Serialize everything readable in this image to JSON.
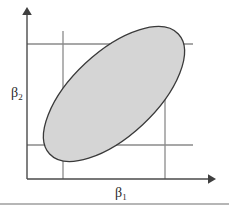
{
  "figure": {
    "background_color": "#ffffff",
    "width": 229,
    "height": 213,
    "axes": {
      "x_axis": {
        "label": "β",
        "label_subscript": "1",
        "label_x": 119,
        "label_y": 197,
        "line_color": "#4a4a4a",
        "origin_x": 27,
        "origin_y": 179,
        "end_x": 215,
        "arrow": "right-arrow"
      },
      "y_axis": {
        "label": "β",
        "label_subscript": "2",
        "label_x": 11,
        "label_y": 97,
        "line_color": "#4a4a4a",
        "origin_x": 27,
        "origin_y": 179,
        "end_y": 8,
        "arrow": "up-arrow"
      }
    },
    "grid": {
      "color": "#8a8a8a",
      "vertical_lines": [
        {
          "x": 63,
          "y_top": 31,
          "y_bottom": 179
        },
        {
          "x": 165,
          "y_top": 31,
          "y_bottom": 179
        }
      ],
      "horizontal_lines": [
        {
          "y": 44,
          "x_left": 27,
          "x_right": 193
        },
        {
          "y": 145,
          "x_left": 27,
          "x_right": 193
        }
      ]
    },
    "confidence_region": {
      "shape": "ellipse",
      "center_x": 114,
      "center_y": 94,
      "semi_major": 88,
      "semi_minor": 42,
      "rotation_deg": -43,
      "fill_color": "#d5d5d5",
      "stroke_color": "#3a3a3a",
      "orientation": "negative-correlation"
    },
    "footer_rule": {
      "y": 204,
      "x_left": 0,
      "x_right": 229,
      "color": "#6f6f6f"
    }
  }
}
